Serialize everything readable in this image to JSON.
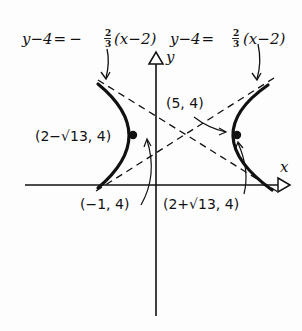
{
  "diagram": {
    "type": "hyperbola-graph",
    "equations": {
      "left_asymptote": {
        "lhs": "y−4",
        "eq": "=",
        "sign": "−",
        "frac_num": "2",
        "frac_den": "3",
        "rhs": "(x−2)"
      },
      "right_asymptote": {
        "lhs": "y−4",
        "eq": "=",
        "sign": "",
        "frac_num": "2",
        "frac_den": "3",
        "rhs": "(x−2)"
      }
    },
    "axes": {
      "x_label": "x",
      "y_label": "y"
    },
    "points": {
      "left_focus": "(2−√13, 4)",
      "right_focus": "(2+√13, 4)",
      "left_vertex": "(−1, 4)",
      "right_vertex": "(5, 4)"
    },
    "center": {
      "x": 2,
      "y": 4
    },
    "colors": {
      "ink": "#111111",
      "background": "#fdfdfd"
    }
  }
}
